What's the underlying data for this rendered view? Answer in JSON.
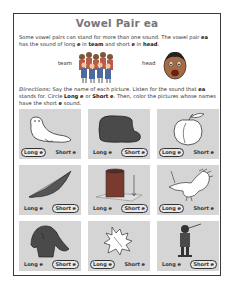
{
  "worksheet": {
    "title": "Vowel Pair ea",
    "intro": {
      "line1": "Some vowel pairs can stand for more than one sound. The vowel pair ",
      "pair": "ea",
      "line2": " has the sound of long ",
      "e1": "e",
      "in1": " in ",
      "word1": "team",
      "and": " and short ",
      "e2": "e",
      "in2": " in ",
      "word2": "head",
      "end": "."
    },
    "examples": [
      {
        "word": "team",
        "icon": "group-of-children-icon"
      },
      {
        "word": "head",
        "icon": "boy-face-icon"
      }
    ],
    "directions": {
      "label": "Directions:",
      "text1": " Say the name of each picture. Listen for the sound that ",
      "pair": "ea",
      "text2": " stands for. Circle ",
      "long": "Long e",
      "or": " or ",
      "short": "Short e",
      "text3": ". Then, color the pictures whose names have the short ",
      "e": "e",
      "text4": " sound."
    },
    "options": {
      "long": "Long e",
      "short": "Short e"
    },
    "cards": [
      {
        "picture": "seal",
        "circled": "long"
      },
      {
        "picture": "bread",
        "circled": "short"
      },
      {
        "picture": "peach",
        "circled": "long"
      },
      {
        "picture": "feather",
        "circled": "short"
      },
      {
        "picture": "thread",
        "circled": "short"
      },
      {
        "picture": "eagle",
        "circled": "long"
      },
      {
        "picture": "sweater",
        "circled": "short"
      },
      {
        "picture": "leaf",
        "circled": "long"
      },
      {
        "picture": "feather-hat",
        "circled": "short"
      }
    ]
  },
  "colors": {
    "border": "#3a3a3a",
    "title": "#777777",
    "card_bg": "#d5d5d5",
    "text": "#333333"
  }
}
